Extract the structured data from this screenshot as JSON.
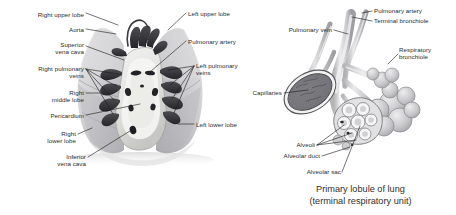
{
  "figure": {
    "background_color": "#ffffff",
    "label_color": "#2b2b2b",
    "leader_color": "#1d1d1d"
  },
  "left_panel": {
    "name": "anterior view of lungs and mediastinum",
    "labels": [
      {
        "id": "right-upper-lobe",
        "text": "Right upper lobe",
        "align": "right",
        "x": 22,
        "y": 11,
        "w": 62
      },
      {
        "id": "aorta",
        "text": "Aorta",
        "align": "right",
        "x": 42,
        "y": 27,
        "w": 42
      },
      {
        "id": "superior-vena-cava",
        "text": "Superior\nvena cava",
        "align": "right",
        "x": 28,
        "y": 43,
        "w": 56
      },
      {
        "id": "right-pulmonary-veins",
        "text": "Right pulmonary\nveins",
        "align": "right",
        "x": 8,
        "y": 66,
        "w": 76
      },
      {
        "id": "right-middle-lobe",
        "text": "Right\nmiddle lobe",
        "align": "right",
        "x": 22,
        "y": 90,
        "w": 62
      },
      {
        "id": "pericardium",
        "text": "Pericardium",
        "align": "right",
        "x": 12,
        "y": 113,
        "w": 72
      },
      {
        "id": "right-lower-lobe",
        "text": "Right\nlower lobe",
        "align": "right",
        "x": 20,
        "y": 131,
        "w": 56
      },
      {
        "id": "inferior-vena-cava",
        "text": "Inferior\nvena cava",
        "align": "right",
        "x": 30,
        "y": 155,
        "w": 56
      },
      {
        "id": "left-upper-lobe",
        "text": "Left upper lobe",
        "align": "left",
        "x": 188,
        "y": 11,
        "w": 66
      },
      {
        "id": "pulmonary-artery-left-panel",
        "text": "Pulmonary artery",
        "align": "left",
        "x": 188,
        "y": 39,
        "w": 70
      },
      {
        "id": "left-pulmonary-veins",
        "text": "Left pulmonary\nveins",
        "align": "left",
        "x": 196,
        "y": 64,
        "w": 68
      },
      {
        "id": "left-lower-lobe",
        "text": "Left lower lobe",
        "align": "left",
        "x": 196,
        "y": 122,
        "w": 66
      }
    ]
  },
  "right_panel": {
    "name": "primary lobule of lung detail",
    "labels": [
      {
        "id": "pulmonary-artery",
        "text": "Pulmonary artery",
        "align": "left",
        "x": 374,
        "y": 8,
        "w": 80
      },
      {
        "id": "terminal-bronchiole",
        "text": "Terminal bronchiole",
        "align": "left",
        "x": 374,
        "y": 18,
        "w": 82
      },
      {
        "id": "pulmonary-vein",
        "text": "Pulmonary vein",
        "align": "right",
        "x": 272,
        "y": 27,
        "w": 60
      },
      {
        "id": "respiratory-bronchiole",
        "text": "Respiratory\nbronchiole",
        "align": "left",
        "x": 399,
        "y": 47,
        "w": 56
      },
      {
        "id": "capillaries",
        "text": "Capillaries",
        "align": "right",
        "x": 238,
        "y": 90,
        "w": 44
      },
      {
        "id": "alveoli",
        "text": "Alveoli",
        "align": "right",
        "x": 283,
        "y": 142,
        "w": 32
      },
      {
        "id": "alveolar-duct",
        "text": "Alveolar duct",
        "align": "right",
        "x": 272,
        "y": 153,
        "w": 48
      },
      {
        "id": "alveolar-sac",
        "text": "Alveolar sac",
        "align": "right",
        "x": 295,
        "y": 169,
        "w": 46
      }
    ],
    "caption": "Primary lobule of lung\n(terminal respiratory unit)"
  }
}
